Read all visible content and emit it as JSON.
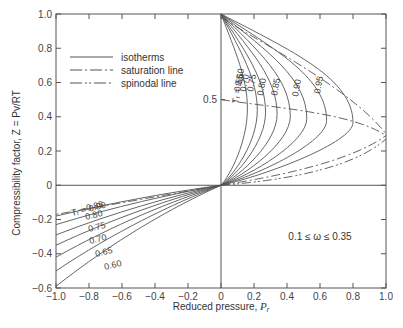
{
  "chart_data": {
    "type": "line",
    "title": "",
    "xlabel": "Reduced pressure, P_r",
    "ylabel": "Compressibility factor, Z = Pv/RT",
    "xlim": [
      -1.0,
      1.0
    ],
    "ylim": [
      -0.6,
      1.0
    ],
    "grid": false,
    "x_ticks": [
      "-1.0",
      "-0.8",
      "-0.6",
      "-0.4",
      "-0.2",
      "0",
      "0.2",
      "0.4",
      "0.6",
      "0.8",
      "1.0"
    ],
    "y_ticks": [
      "-0.6",
      "-0.4",
      "-0.2",
      "0",
      "0.2",
      "0.4",
      "0.6",
      "0.8",
      "1.0"
    ],
    "legend": {
      "position": "upper-left",
      "entries": [
        {
          "label": "isotherms",
          "style": "solid"
        },
        {
          "label": "saturation line",
          "style": "dash-dot"
        },
        {
          "label": "spinodal line",
          "style": "dash-dot-dot"
        }
      ]
    },
    "annotations": {
      "omega_range": "0.1 ≤ ω ≤ 0.35",
      "marker_05": "0.5",
      "tr_prefix_upper": "T_r = 0.60",
      "tr_prefix_lower": "T_r = 0.90"
    },
    "series": [
      {
        "name": "Tr=0.60",
        "upper_label": "0.60",
        "lower_label": "0.60",
        "x_right_max": 0.16,
        "z_at_neg1": -0.59
      },
      {
        "name": "Tr=0.65",
        "upper_label": "0.65",
        "lower_label": "0.65",
        "x_right_max": 0.22,
        "z_at_neg1": -0.5
      },
      {
        "name": "Tr=0.70",
        "upper_label": "0.70",
        "lower_label": "0.70",
        "x_right_max": 0.27,
        "z_at_neg1": -0.42
      },
      {
        "name": "Tr=0.75",
        "upper_label": "0.75",
        "lower_label": "0.75",
        "x_right_max": 0.34,
        "z_at_neg1": -0.35
      },
      {
        "name": "Tr=0.80",
        "upper_label": "0.80",
        "lower_label": "0.80",
        "x_right_max": 0.42,
        "z_at_neg1": -0.29
      },
      {
        "name": "Tr=0.85",
        "upper_label": "0.85",
        "lower_label": "0.85",
        "x_right_max": 0.52,
        "z_at_neg1": -0.23
      },
      {
        "name": "Tr=0.90",
        "upper_label": "0.90",
        "lower_label": "0.90",
        "x_right_max": 0.64,
        "z_at_neg1": -0.18
      },
      {
        "name": "Tr=0.95",
        "upper_label": "0.95",
        "lower_label": "",
        "x_right_max": 0.8,
        "z_at_neg1": null
      }
    ]
  },
  "labels": {
    "xlabel": "Reduced pressure, ",
    "xlabel_sym": "P",
    "xlabel_sub": "r",
    "ylabel": "Compressibility factor, Z = Pv/RT"
  }
}
